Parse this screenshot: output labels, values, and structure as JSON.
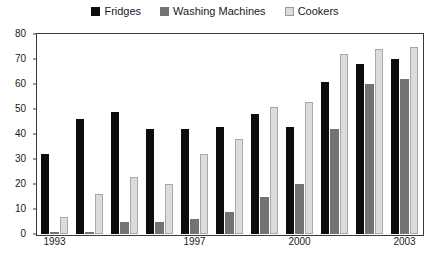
{
  "legend": {
    "position": "top-center",
    "entries": [
      {
        "label": "Fridges",
        "color": "#0d0d0d",
        "icon": "square-swatch-icon"
      },
      {
        "label": "Washing Machines",
        "color": "#737373",
        "icon": "square-swatch-icon"
      },
      {
        "label": "Cookers",
        "color": "#dcdcdc",
        "icon": "square-swatch-icon"
      }
    ]
  },
  "axes": {
    "y_ticks": [
      "0",
      "10",
      "20",
      "30",
      "40",
      "50",
      "60",
      "70",
      "80"
    ],
    "y_min": 0,
    "y_max": 80,
    "y_step": 10,
    "x_labels": [
      {
        "text": "1993",
        "group_index": 0
      },
      {
        "text": "1997",
        "group_index": 4
      },
      {
        "text": "2000",
        "group_index": 7
      },
      {
        "text": "2003",
        "group_index": 10
      }
    ]
  },
  "chart_data": {
    "type": "bar",
    "title": "",
    "xlabel": "",
    "ylabel": "",
    "ylim": [
      0,
      80
    ],
    "grid": false,
    "legend_position": "top-center",
    "categories": [
      "1993",
      "1994",
      "1995",
      "1996",
      "1997",
      "1998",
      "1999",
      "2000",
      "2001",
      "2002",
      "2003"
    ],
    "tick_labels_shown": [
      "1993",
      "1997",
      "2000",
      "2003"
    ],
    "series": [
      {
        "name": "Fridges",
        "color": "#0d0d0d",
        "values": [
          32,
          46,
          49,
          42,
          42,
          43,
          48,
          43,
          61,
          68,
          70
        ]
      },
      {
        "name": "Washing Machines",
        "color": "#737373",
        "values": [
          1,
          1,
          5,
          5,
          6,
          9,
          15,
          20,
          42,
          60,
          62
        ]
      },
      {
        "name": "Cookers",
        "color": "#dcdcdc",
        "values": [
          7,
          16,
          23,
          20,
          32,
          38,
          51,
          53,
          72,
          74,
          75
        ]
      }
    ]
  }
}
